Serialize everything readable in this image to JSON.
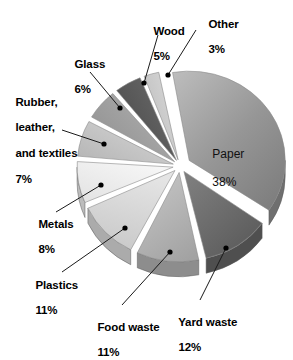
{
  "chart_data": {
    "type": "pie",
    "title": "",
    "subtitle": "",
    "xlabel": "",
    "ylabel": "",
    "legend_position": "callout-labels",
    "grid": false,
    "exploded": true,
    "three_d": true,
    "units": "percent",
    "categories": [
      "Paper",
      "Yard waste",
      "Food waste",
      "Plastics",
      "Metals",
      "Rubber, leather, and textiles",
      "Glass",
      "Wood",
      "Other"
    ],
    "values": [
      38,
      12,
      11,
      11,
      8,
      7,
      6,
      5,
      3
    ],
    "slices": [
      {
        "name": "Paper",
        "label": "Paper",
        "value": 38,
        "value_text": "38%",
        "color": "#8e8e8e",
        "color_dark": "#6f6f6f",
        "start_angle": 0,
        "end_angle": 136.8
      },
      {
        "name": "Yard waste",
        "label": "Yard waste",
        "value": 12,
        "value_text": "12%",
        "color": "#6b6b6b",
        "color_dark": "#4f4f4f",
        "start_angle": 136.8,
        "end_angle": 180.0
      },
      {
        "name": "Food waste",
        "label": "Food waste",
        "value": 11,
        "value_text": "11%",
        "color": "#b4b4b4",
        "color_dark": "#8d8d8d",
        "start_angle": 180.0,
        "end_angle": 219.6
      },
      {
        "name": "Plastics",
        "label": "Plastics",
        "value": 11,
        "value_text": "11%",
        "color": "#d9d9d9",
        "color_dark": "#ababab",
        "start_angle": 219.6,
        "end_angle": 259.2
      },
      {
        "name": "Metals",
        "label": "Metals",
        "value": 8,
        "value_text": "8%",
        "color": "#efefef",
        "color_dark": "#bcbcbc",
        "start_angle": 259.2,
        "end_angle": 288.0
      },
      {
        "name": "Rubber, leather, and textiles",
        "label": "Rubber,\nleather,\nand textiles",
        "value": 7,
        "value_text": "7%",
        "color": "#c6c6c6",
        "color_dark": "#9a9a9a",
        "start_angle": 288.0,
        "end_angle": 313.2
      },
      {
        "name": "Glass",
        "label": "Glass",
        "value": 6,
        "value_text": "6%",
        "color": "#a0a0a0",
        "color_dark": "#7c7c7c",
        "start_angle": 313.2,
        "end_angle": 334.8
      },
      {
        "name": "Wood",
        "label": "Wood",
        "value": 5,
        "value_text": "5%",
        "color": "#5a5a5a",
        "color_dark": "#3f3f3f",
        "start_angle": 334.8,
        "end_angle": 352.8
      },
      {
        "name": "Other",
        "label": "Other",
        "value": 3,
        "value_text": "3%",
        "color": "#c9c9c9",
        "color_dark": "#9d9d9d",
        "start_angle": 352.8,
        "end_angle": 363.6
      }
    ]
  },
  "labels": {
    "paper": {
      "name": "Paper",
      "percent": "38%"
    },
    "yard_waste": {
      "name": "Yard waste",
      "percent": "12%"
    },
    "food_waste": {
      "name": "Food waste",
      "percent": "11%"
    },
    "plastics": {
      "name": "Plastics",
      "percent": "11%"
    },
    "metals": {
      "name": "Metals",
      "percent": "8%"
    },
    "rubber": {
      "name_line1": "Rubber,",
      "name_line2": "leather,",
      "name_line3": "and textiles",
      "percent": "7%"
    },
    "glass": {
      "name": "Glass",
      "percent": "6%"
    },
    "wood": {
      "name": "Wood",
      "percent": "5%"
    },
    "other": {
      "name": "Other",
      "percent": "3%"
    }
  },
  "style": {
    "background": "#ffffff",
    "leader_line_color": "#1a1a1a",
    "marker_color": "#000000",
    "text_color": "#000000"
  }
}
